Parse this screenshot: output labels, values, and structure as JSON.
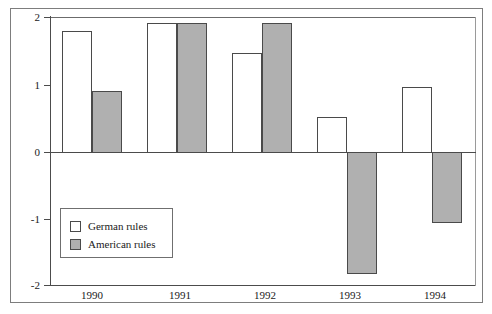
{
  "chart_data": {
    "type": "bar",
    "title": "",
    "subtitle": "",
    "xlabel": "",
    "ylabel": "",
    "categories": [
      "1990",
      "1991",
      "1992",
      "1993",
      "1994"
    ],
    "series": [
      {
        "name": "German rules",
        "values": [
          1.79,
          1.91,
          1.46,
          0.52,
          0.97
        ]
      },
      {
        "name": "American rules",
        "values": [
          0.9,
          1.91,
          1.91,
          -1.79,
          -1.04
        ]
      }
    ],
    "ylim": [
      -2,
      2
    ],
    "yticks": [
      2,
      1,
      0,
      -1,
      -2
    ],
    "ytick_labels": [
      "2",
      "1",
      "0",
      "-1",
      "-2"
    ],
    "grid": false,
    "zero_line": true,
    "legend_position": "lower-left-inside",
    "colors": {
      "german": "#ffffff",
      "american": "#b0b0b0",
      "bar_outline": "#4a4a4a",
      "axis": "#4c4c4c",
      "frame": "#7d7d7d",
      "text": "#1a1a1a",
      "background": "#ffffff"
    }
  },
  "legend": {
    "items": [
      {
        "label": "German rules",
        "swatch": "german"
      },
      {
        "label": "American rules",
        "swatch": "american"
      }
    ]
  },
  "axis": {
    "y_labels": [
      "2",
      "1",
      "0",
      "-1",
      "-2"
    ],
    "x_labels": [
      "1990",
      "1991",
      "1992",
      "1993",
      "1994"
    ]
  }
}
